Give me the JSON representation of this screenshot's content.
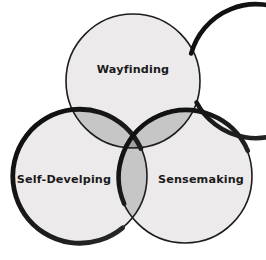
{
  "diagram": {
    "type": "venn-3-circle",
    "background_color": "#ffffff",
    "stroke_color": "#111111",
    "label_color": "#1b1b1b",
    "fill_single": "#eceaea",
    "fill_pair": "#c6c6c6",
    "fill_triple": "#a0a0a0",
    "circles": [
      {
        "id": "wayfinding",
        "label": "Wayfinding",
        "position": "top",
        "cx": 133,
        "cy": 81,
        "r": 67,
        "label_x": 133,
        "label_y": 70
      },
      {
        "id": "self-develping",
        "label": "Self-Develping",
        "position": "bottom-left",
        "cx": 80,
        "cy": 176,
        "r": 67,
        "label_x": 64,
        "label_y": 180
      },
      {
        "id": "sensemaking",
        "label": "Sensemaking",
        "position": "bottom-right",
        "cx": 185,
        "cy": 176,
        "r": 67,
        "label_x": 201,
        "label_y": 180
      }
    ]
  }
}
